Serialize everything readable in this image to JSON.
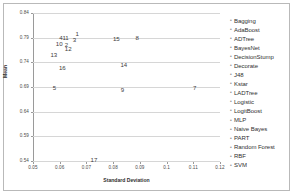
{
  "chart_data": {
    "type": "scatter",
    "title": "",
    "xlabel": "Standard Deviation",
    "ylabel": "Mean",
    "xlim": [
      0.05,
      0.12
    ],
    "ylim": [
      0.54,
      0.84
    ],
    "xticks": [
      "0.05",
      "0.06",
      "0.07",
      "0.08",
      "0.09",
      "0.1",
      "0.11",
      "0.12"
    ],
    "xtick_values": [
      0.05,
      0.06,
      0.07,
      0.08,
      0.09,
      0.1,
      0.11,
      0.12
    ],
    "yticks": [
      "0.84",
      "0.79",
      "0.74",
      "0.69",
      "0.64",
      "0.59",
      "0.54"
    ],
    "ytick_values": [
      0.84,
      0.79,
      0.74,
      0.69,
      0.64,
      0.59,
      0.54
    ],
    "grid": true,
    "legend_position": "right",
    "point_label_mode": "numeric-index",
    "points": [
      {
        "label": "1",
        "name": "Bagging",
        "x": 0.0665,
        "y": 0.8
      },
      {
        "label": "2",
        "name": "AdaBoost",
        "x": 0.0625,
        "y": 0.778
      },
      {
        "label": "3",
        "name": "ADTree",
        "x": 0.0655,
        "y": 0.787
      },
      {
        "label": "4",
        "name": "BayesNet",
        "x": 0.0605,
        "y": 0.792
      },
      {
        "label": "5",
        "name": "DecisionStump",
        "x": 0.058,
        "y": 0.69
      },
      {
        "label": "7",
        "name": "J48",
        "x": 0.1105,
        "y": 0.69
      },
      {
        "label": "8",
        "name": "Kstar",
        "x": 0.089,
        "y": 0.791
      },
      {
        "label": "9",
        "name": "LADTree",
        "x": 0.0835,
        "y": 0.686
      },
      {
        "label": "10",
        "name": "Logistic",
        "x": 0.0598,
        "y": 0.78
      },
      {
        "label": "11",
        "name": "LogitBoost",
        "x": 0.0622,
        "y": 0.792
      },
      {
        "label": "12",
        "name": "MLP",
        "x": 0.0632,
        "y": 0.769
      },
      {
        "label": "13",
        "name": "Naive Bayes",
        "x": 0.0578,
        "y": 0.757
      },
      {
        "label": "14",
        "name": "Random Forest",
        "x": 0.084,
        "y": 0.737
      },
      {
        "label": "15",
        "name": "RBF",
        "x": 0.0812,
        "y": 0.79
      },
      {
        "label": "16",
        "name": "SVM",
        "x": 0.061,
        "y": 0.73
      },
      {
        "label": "17",
        "name": "PART",
        "x": 0.0728,
        "y": 0.545
      }
    ],
    "legend": [
      {
        "index": 1,
        "label": "Bagging"
      },
      {
        "index": 2,
        "label": "AdaBoost"
      },
      {
        "index": 3,
        "label": "ADTree"
      },
      {
        "index": 4,
        "label": "BayesNet"
      },
      {
        "index": 5,
        "label": "DecisionStump"
      },
      {
        "index": 6,
        "label": "Decorate"
      },
      {
        "index": 7,
        "label": "J48"
      },
      {
        "index": 8,
        "label": "Kstar"
      },
      {
        "index": 9,
        "label": "LADTree"
      },
      {
        "index": 10,
        "label": "Logistic"
      },
      {
        "index": 11,
        "label": "LogitBoost"
      },
      {
        "index": 12,
        "label": "MLP"
      },
      {
        "index": 13,
        "label": "Naive Bayes"
      },
      {
        "index": 14,
        "label": "PART"
      },
      {
        "index": 15,
        "label": "Random Forest"
      },
      {
        "index": 16,
        "label": "RBF"
      },
      {
        "index": 17,
        "label": "SVM"
      }
    ],
    "legend_marker": "•"
  }
}
